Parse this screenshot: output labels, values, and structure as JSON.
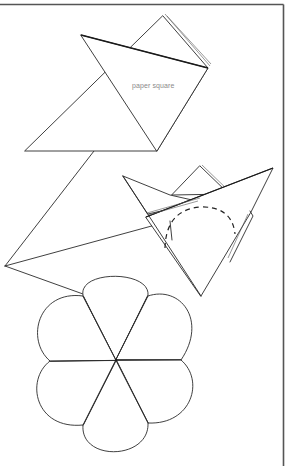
{
  "figure": {
    "type": "paper-folding instruction diagram",
    "labels": {
      "paper_square": "paper square"
    },
    "steps": [
      {
        "name": "folded-square",
        "description": "Square of paper folded diagonally into a triangle, with a folded flap at the back"
      },
      {
        "name": "folded-cone",
        "description": "Triangle folded into a cone shape with a dashed arc marking the cut line"
      },
      {
        "name": "six-petal-flower",
        "description": "Unfolded result: six rounded petals radiating from a center point"
      }
    ],
    "colors": {
      "line": "#2a2a2a",
      "frame": "#555555",
      "label": "#8a8a8a",
      "background": "#ffffff"
    }
  }
}
